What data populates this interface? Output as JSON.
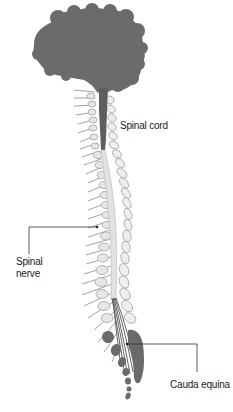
{
  "diagram": {
    "colors": {
      "brain": "#6b6b6b",
      "cord_dark": "#5e5e5e",
      "cord_light": "#e2e2e2",
      "vertebra_fill": "#eeeeee",
      "vertebra_stroke": "#9a9a9a",
      "sacral_dark": "#6a6a6a",
      "nerve": "#8a8a8a",
      "leader_line": "#333333",
      "label_text": "#222222"
    },
    "labels": {
      "spinal_cord": "Spinal cord",
      "spinal_nerve_line1": "Spinal",
      "spinal_nerve_line2": "nerve",
      "cauda_equina": "Cauda equina"
    }
  }
}
